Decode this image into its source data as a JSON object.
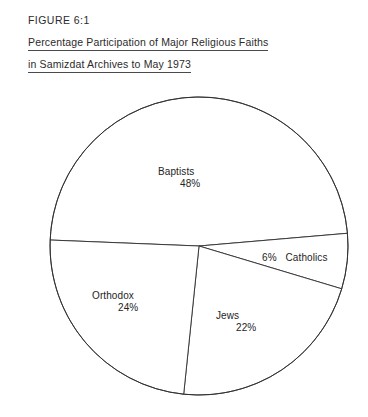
{
  "figure": {
    "number_label": "FIGURE 6:1",
    "caption_line_1": "Percentage Participation of Major Religious Faiths",
    "caption_line_2": "in Samizdat Archives to May 1973"
  },
  "chart_data": {
    "type": "pie",
    "title": "Percentage Participation of Major Religious Faiths in Samizdat Archives to May 1973",
    "xlabel": "",
    "ylabel": "",
    "unit": "percent",
    "total": 100,
    "legend_position": "none",
    "grid": false,
    "labels_inside_slices": true,
    "categories": [
      "Baptists",
      "Catholics",
      "Jews",
      "Orthodox"
    ],
    "values": [
      48,
      22,
      24,
      6
    ],
    "slices": [
      {
        "name": "Baptists",
        "value": 48,
        "value_label": "48%",
        "start_angle_deg": 182.3,
        "sweep_deg": 172.8,
        "fill": "#ffffff",
        "stroke": "#2f2f2f"
      },
      {
        "name": "Catholics",
        "value": 6,
        "value_label": "6%",
        "start_angle_deg": 355.1,
        "sweep_deg": 21.6,
        "fill": "#ffffff",
        "stroke": "#2f2f2f"
      },
      {
        "name": "Jews",
        "value": 22,
        "value_label": "22%",
        "start_angle_deg": 16.7,
        "sweep_deg": 79.2,
        "fill": "#ffffff",
        "stroke": "#2f2f2f"
      },
      {
        "name": "Orthodox",
        "value": 24,
        "value_label": "24%",
        "start_angle_deg": 95.9,
        "sweep_deg": 86.4,
        "fill": "#ffffff",
        "stroke": "#2f2f2f"
      }
    ]
  },
  "colors": {
    "background": "#ffffff",
    "ink": "#2f2f2f",
    "text": "#242424",
    "rule": "#4a4a4a"
  }
}
